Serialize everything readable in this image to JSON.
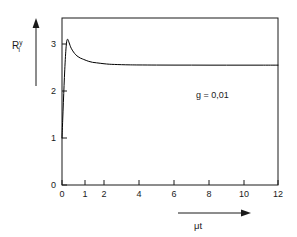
{
  "chart_data": {
    "type": "line",
    "title": "",
    "subtitle": "",
    "xlabel": "μt",
    "ylabel": "R",
    "ylabel_superscript": "y",
    "ylabel_subscript": "i",
    "annotations": [
      {
        "text": "g = 0,01",
        "x": 7.2,
        "y": 2.12
      }
    ],
    "grid": false,
    "legend": null,
    "xlim": [
      0,
      12
    ],
    "ylim": [
      0,
      3.5
    ],
    "x_axis_scale": "piecewise-compressed",
    "xticks": [
      0,
      1,
      2,
      4,
      6,
      8,
      10,
      12
    ],
    "xticklabels": [
      "0",
      "1",
      "2",
      "4",
      "6",
      "8",
      "10",
      "12"
    ],
    "yticks": [
      0,
      1,
      2,
      3
    ],
    "yticklabels": [
      "0",
      "1",
      "2",
      "3"
    ],
    "series": [
      {
        "name": "R_i^y",
        "color": "#000000",
        "x": [
          0,
          0.03,
          0.06,
          0.09,
          0.12,
          0.15,
          0.18,
          0.21,
          0.25,
          0.3,
          0.35,
          0.4,
          0.5,
          0.6,
          0.7,
          0.8,
          0.9,
          1.0,
          1.2,
          1.4,
          1.6,
          1.8,
          2.0,
          2.3,
          2.6,
          3.0,
          3.5,
          4.0,
          5.0,
          6.0,
          7.0,
          8.0,
          9.0,
          10.0,
          11.0,
          12.0
        ],
        "y": [
          1.0,
          1.38,
          1.76,
          2.12,
          2.45,
          2.73,
          2.94,
          3.07,
          3.1,
          3.04,
          2.97,
          2.91,
          2.83,
          2.77,
          2.73,
          2.7,
          2.68,
          2.66,
          2.63,
          2.61,
          2.6,
          2.59,
          2.58,
          2.57,
          2.565,
          2.56,
          2.556,
          2.554,
          2.552,
          2.551,
          2.551,
          2.55,
          2.55,
          2.55,
          2.55,
          2.55
        ]
      }
    ],
    "peak": {
      "x": 0.23,
      "y": 3.1
    },
    "start": {
      "x": 0,
      "y": 1.0
    },
    "asymptote": 2.55
  },
  "axes": {
    "y_arrow": "up-arrow-icon",
    "x_arrow": "right-arrow-icon"
  },
  "colors": {
    "line": "#000000",
    "frame": "#1a1a1a",
    "background": "#ffffff",
    "text": "#1a1a1a"
  }
}
